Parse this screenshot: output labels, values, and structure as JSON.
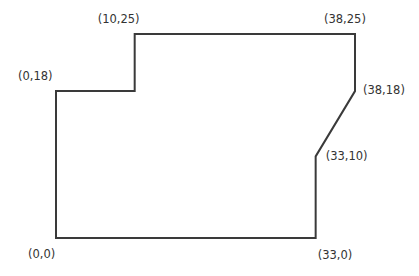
{
  "diagram": {
    "type": "polygon-floor-plan",
    "stroke_color": "#3a3a3a",
    "label_color": "#333333",
    "vertices": [
      {
        "x": 0,
        "y": 0,
        "label": "(0,0)"
      },
      {
        "x": 0,
        "y": 18,
        "label": "(0,18)"
      },
      {
        "x": 10,
        "y": 18,
        "label": ""
      },
      {
        "x": 10,
        "y": 25,
        "label": "(10,25)"
      },
      {
        "x": 38,
        "y": 25,
        "label": "(38,25)"
      },
      {
        "x": 38,
        "y": 18,
        "label": "(38,18)"
      },
      {
        "x": 33,
        "y": 10,
        "label": "(33,10)"
      },
      {
        "x": 33,
        "y": 0,
        "label": "(33,0)"
      }
    ]
  }
}
